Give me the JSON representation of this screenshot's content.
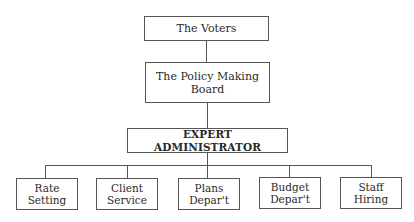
{
  "diagram": {
    "type": "org-chart",
    "nodes": {
      "voters": {
        "label": "The Voters"
      },
      "board": {
        "label": "The Policy Making Board"
      },
      "admin": {
        "label": "EXPERT ADMINISTRATOR"
      },
      "departments": [
        {
          "line1": "Rate",
          "line2": "Setting"
        },
        {
          "line1": "Client",
          "line2": "Service"
        },
        {
          "line1": "Plans",
          "line2": "Depar't"
        },
        {
          "line1": "Budget",
          "line2": "Depar't"
        },
        {
          "line1": "Staff",
          "line2": "Hiring"
        }
      ]
    },
    "edges": [
      [
        "The Voters",
        "The Policy Making Board"
      ],
      [
        "The Policy Making Board",
        "EXPERT ADMINISTRATOR"
      ],
      [
        "EXPERT ADMINISTRATOR",
        "Rate Setting"
      ],
      [
        "EXPERT ADMINISTRATOR",
        "Client Service"
      ],
      [
        "EXPERT ADMINISTRATOR",
        "Plans Depar't"
      ],
      [
        "EXPERT ADMINISTRATOR",
        "Budget Depar't"
      ],
      [
        "EXPERT ADMINISTRATOR",
        "Staff Hiring"
      ]
    ]
  }
}
